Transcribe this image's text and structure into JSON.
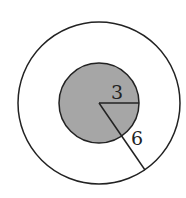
{
  "diagram": {
    "type": "concentric-circles",
    "outer_circle": {
      "cx": 99,
      "cy": 103,
      "r": 81,
      "fill": "#ffffff",
      "stroke": "#222222"
    },
    "inner_circle": {
      "cx": 99,
      "cy": 103,
      "r": 40,
      "fill": "#a6a6a6",
      "stroke": "#222222"
    },
    "inner_radius_label": "3",
    "outer_radius_label": "6"
  }
}
